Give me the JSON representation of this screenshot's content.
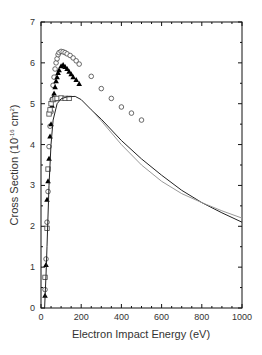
{
  "chart_data": {
    "type": "scatter",
    "title": "",
    "xlabel": "Electron Impact Energy (eV)",
    "ylabel": "Cross Section (10",
    "ylabel_exp": "-16",
    "ylabel_unit": " cm",
    "ylabel_unit_exp": "2",
    "ylabel_close": ")",
    "xlim": [
      0,
      1000
    ],
    "ylim": [
      0,
      7
    ],
    "x_ticks": [
      0,
      200,
      400,
      600,
      800,
      1000
    ],
    "y_ticks": [
      0,
      1,
      2,
      3,
      4,
      5,
      6,
      7
    ],
    "grid": false,
    "legend": null,
    "series": [
      {
        "name": "open circles",
        "marker": "circle",
        "points": [
          [
            20,
            0.45
          ],
          [
            25,
            1.2
          ],
          [
            30,
            2.1
          ],
          [
            35,
            2.85
          ],
          [
            40,
            3.95
          ],
          [
            45,
            4.45
          ],
          [
            50,
            4.8
          ],
          [
            55,
            5.1
          ],
          [
            60,
            5.45
          ],
          [
            65,
            5.65
          ],
          [
            70,
            5.85
          ],
          [
            75,
            6.0
          ],
          [
            80,
            6.1
          ],
          [
            85,
            6.2
          ],
          [
            90,
            6.25
          ],
          [
            100,
            6.28
          ],
          [
            110,
            6.27
          ],
          [
            120,
            6.25
          ],
          [
            130,
            6.22
          ],
          [
            145,
            6.18
          ],
          [
            160,
            6.12
          ],
          [
            175,
            6.05
          ],
          [
            190,
            5.97
          ],
          [
            250,
            5.67
          ],
          [
            300,
            5.37
          ],
          [
            350,
            5.13
          ],
          [
            400,
            4.92
          ],
          [
            450,
            4.77
          ],
          [
            500,
            4.6
          ]
        ]
      },
      {
        "name": "filled triangles",
        "marker": "triangle",
        "points": [
          [
            20,
            0.3
          ],
          [
            25,
            1.05
          ],
          [
            30,
            2.65
          ],
          [
            35,
            3.1
          ],
          [
            40,
            3.65
          ],
          [
            45,
            4.2
          ],
          [
            50,
            4.5
          ],
          [
            55,
            4.95
          ],
          [
            60,
            5.15
          ],
          [
            65,
            5.25
          ],
          [
            70,
            5.4
          ],
          [
            75,
            5.55
          ],
          [
            80,
            5.65
          ],
          [
            85,
            5.75
          ],
          [
            90,
            5.82
          ],
          [
            100,
            5.92
          ],
          [
            110,
            5.95
          ],
          [
            120,
            5.9
          ],
          [
            130,
            5.85
          ],
          [
            140,
            5.78
          ],
          [
            150,
            5.72
          ],
          [
            160,
            5.65
          ],
          [
            175,
            5.58
          ],
          [
            190,
            5.48
          ]
        ]
      },
      {
        "name": "open squares",
        "marker": "square",
        "points": [
          [
            20,
            0.75
          ],
          [
            30,
            1.95
          ],
          [
            35,
            3.4
          ],
          [
            40,
            4.75
          ],
          [
            45,
            4.85
          ],
          [
            50,
            5.0
          ],
          [
            60,
            5.1
          ],
          [
            70,
            5.12
          ],
          [
            80,
            5.13
          ],
          [
            100,
            5.14
          ],
          [
            120,
            5.13
          ],
          [
            140,
            5.13
          ]
        ]
      },
      {
        "name": "theory (dark line)",
        "marker": "line",
        "color": "#222222",
        "points": [
          [
            18,
            0
          ],
          [
            25,
            0.8
          ],
          [
            30,
            1.5
          ],
          [
            40,
            3.0
          ],
          [
            50,
            4.0
          ],
          [
            60,
            4.6
          ],
          [
            80,
            5.0
          ],
          [
            100,
            5.12
          ],
          [
            130,
            5.17
          ],
          [
            170,
            5.18
          ],
          [
            200,
            5.1
          ],
          [
            250,
            4.85
          ],
          [
            300,
            4.62
          ],
          [
            400,
            4.1
          ],
          [
            500,
            3.65
          ],
          [
            600,
            3.25
          ],
          [
            700,
            2.88
          ],
          [
            800,
            2.58
          ],
          [
            900,
            2.33
          ],
          [
            1000,
            2.1
          ]
        ]
      },
      {
        "name": "theory (light line)",
        "marker": "line",
        "color": "#999999",
        "points": [
          [
            250,
            4.85
          ],
          [
            300,
            4.58
          ],
          [
            400,
            4.0
          ],
          [
            500,
            3.5
          ],
          [
            600,
            3.1
          ],
          [
            700,
            2.8
          ],
          [
            800,
            2.58
          ],
          [
            900,
            2.38
          ],
          [
            1000,
            2.2
          ]
        ]
      }
    ]
  }
}
